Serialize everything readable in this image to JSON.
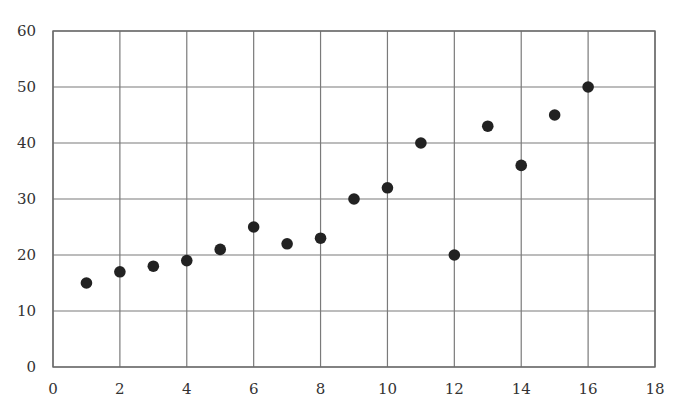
{
  "chart_data": {
    "type": "scatter",
    "title": "",
    "xlabel": "",
    "ylabel": "",
    "xlim": [
      0,
      18
    ],
    "ylim": [
      0,
      60
    ],
    "x_ticks": [
      0,
      2,
      4,
      6,
      8,
      10,
      12,
      14,
      16,
      18
    ],
    "y_ticks": [
      0,
      10,
      20,
      30,
      40,
      50,
      60
    ],
    "grid": true,
    "legend": null,
    "series": [
      {
        "name": "data",
        "color": "#222222",
        "points": [
          {
            "x": 1,
            "y": 15
          },
          {
            "x": 2,
            "y": 17
          },
          {
            "x": 3,
            "y": 18
          },
          {
            "x": 4,
            "y": 19
          },
          {
            "x": 5,
            "y": 21
          },
          {
            "x": 6,
            "y": 25
          },
          {
            "x": 7,
            "y": 22
          },
          {
            "x": 8,
            "y": 23
          },
          {
            "x": 9,
            "y": 30
          },
          {
            "x": 10,
            "y": 32
          },
          {
            "x": 11,
            "y": 40
          },
          {
            "x": 12,
            "y": 20
          },
          {
            "x": 13,
            "y": 43
          },
          {
            "x": 14,
            "y": 36
          },
          {
            "x": 15,
            "y": 45
          },
          {
            "x": 16,
            "y": 50
          }
        ]
      }
    ]
  },
  "colors": {
    "grid": "#7a7a7a",
    "marker": "#222222",
    "text": "#333333"
  }
}
